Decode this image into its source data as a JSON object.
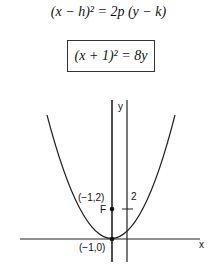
{
  "equations": {
    "general": "(x − h)² = 2p (y − k)",
    "specific": "(x + 1)² = 8y"
  },
  "graph": {
    "x_axis_label": "x",
    "y_axis_label": "y",
    "focus_label": "F",
    "focus_coords": "(−1,2)",
    "vertex_coords": "(−1,0)",
    "tick_label": "2"
  }
}
